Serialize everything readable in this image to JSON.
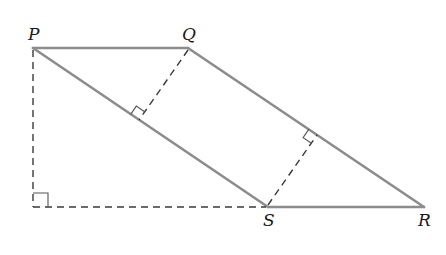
{
  "diagram": {
    "colors": {
      "solid_line": "#8c8c8c",
      "dashed_line": "#3a3a3a",
      "label": "#1a1a1a",
      "background": "#ffffff"
    },
    "vertices": {
      "P": {
        "label": "P",
        "x": 33,
        "y": 48
      },
      "Q": {
        "label": "Q",
        "x": 188,
        "y": 48
      },
      "R": {
        "label": "R",
        "x": 424,
        "y": 207
      },
      "S": {
        "label": "S",
        "x": 268,
        "y": 207
      }
    },
    "labels": {
      "P": "P",
      "Q": "Q",
      "R": "R",
      "S": "S"
    },
    "solid_segments": [
      "PQ",
      "QR",
      "RS",
      "PS"
    ],
    "dashed_segments": [
      "P to foot (33,207) vertical height",
      "foot (33,207) to S horizontal extension",
      "Q perpendicular to PS",
      "S perpendicular to QR"
    ],
    "right_angle_markers": 3
  }
}
